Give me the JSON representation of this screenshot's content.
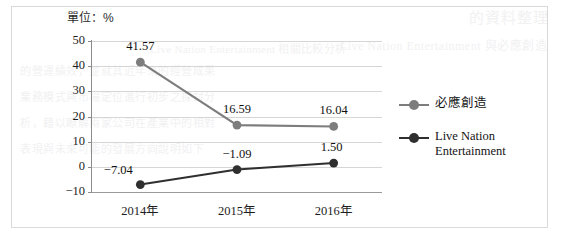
{
  "figure": {
    "unit_label": "單位：%",
    "frame_color": "#d9d9d9"
  },
  "chart_data": {
    "type": "line",
    "title": "",
    "subtitle": "",
    "xlabel": "",
    "ylabel": "單位：%",
    "categories": [
      "2014年",
      "2015年",
      "2016年"
    ],
    "ylim": [
      -10,
      50
    ],
    "yticks": [
      50,
      40,
      30,
      20,
      10,
      0,
      -10
    ],
    "ytick_labels": [
      "50",
      "40",
      "30",
      "20",
      "10",
      "0",
      "−10"
    ],
    "grid": true,
    "legend_position": "right",
    "series": [
      {
        "name": "必應創造",
        "color": "#7d7d7d",
        "marker": "circle",
        "values": [
          41.57,
          16.59,
          16.04
        ],
        "labels": [
          "41.57",
          "16.59",
          "16.04"
        ]
      },
      {
        "name": "Live Nation Entertainment",
        "color": "#2f2f2f",
        "marker": "circle",
        "values": [
          -7.04,
          -1.09,
          1.5
        ],
        "labels": [
          "−7.04",
          "−1.09",
          "1.50"
        ]
      }
    ]
  },
  "legend": {
    "items": [
      {
        "label": "必應創造",
        "label_line2": "",
        "color": "#7d7d7d"
      },
      {
        "label": "Live Nation",
        "label_line2": "Entertainment",
        "color": "#2f2f2f"
      }
    ]
  },
  "bleedthrough": {
    "cjk_1": "的資料整理",
    "lat_1": "Live Nation Entertainment 與必應創造",
    "lat_2": "Live Nation Entertainment 相關比較分析",
    "cjk_2": "的營運績效，並就其近年來的經營成果",
    "cjk_3": "業務模式與市場定位進行初步之探討分",
    "cjk_4": "析，藉以瞭解兩家公司在產業中的相對",
    "cjk_5": "表現與未來可能的發展方向說明如下"
  }
}
